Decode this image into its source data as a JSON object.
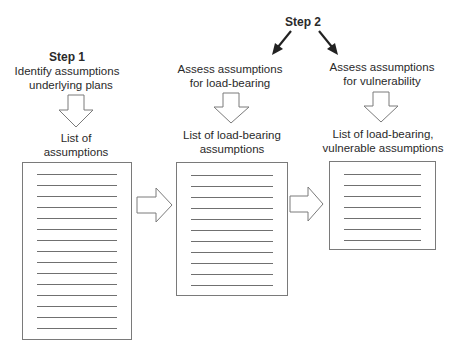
{
  "step1": {
    "title": "Step 1",
    "action_line1": "Identify assumptions",
    "action_line2": "underlying plans",
    "output_line1": "List of",
    "output_line2": "assumptions",
    "document_line_count": 15
  },
  "step2": {
    "title": "Step 2",
    "branch_a": {
      "action_line1": "Assess assumptions",
      "action_line2": "for load-bearing",
      "output_line1": "List of load-bearing",
      "output_line2": "assumptions",
      "document_line_count": 11
    },
    "branch_b": {
      "action_line1": "Assess assumptions",
      "action_line2": "for vulnerability",
      "output_line1": "List of load-bearing,",
      "output_line2": "vulnerable assumptions",
      "document_line_count": 7
    }
  },
  "colors": {
    "stroke": "#7a7a7a",
    "text": "#2a2a2a",
    "bold_arrow": "#222222",
    "background": "#ffffff"
  }
}
